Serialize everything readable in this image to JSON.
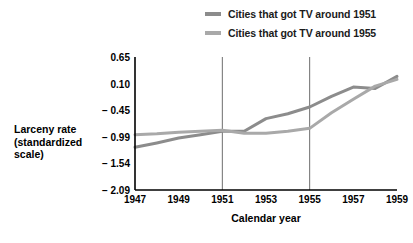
{
  "chart_data": {
    "type": "line",
    "title": "",
    "xlabel": "Calendar year",
    "ylabel": "Larceny rate (standardized scale)",
    "ylabel_lines": [
      "Larceny rate",
      "(standardized",
      "scale)"
    ],
    "x": [
      1947,
      1948,
      1949,
      1950,
      1951,
      1952,
      1953,
      1954,
      1955,
      1956,
      1957,
      1958,
      1959
    ],
    "xticks": [
      "1947",
      "1949",
      "1951",
      "1953",
      "1955",
      "1957",
      "1959"
    ],
    "xtick_values": [
      1947,
      1949,
      1951,
      1953,
      1955,
      1957,
      1959
    ],
    "yticks": [
      "0.65",
      "0.10",
      "− 0.45",
      "− 0.99",
      "− 1.54",
      "− 2.09"
    ],
    "ytick_values": [
      0.65,
      0.1,
      -0.45,
      -0.99,
      -1.54,
      -2.09
    ],
    "xlim": [
      1947,
      1959
    ],
    "ylim": [
      -2.09,
      0.65
    ],
    "grid": false,
    "legend_position": "top-right",
    "reference_lines": [
      1951,
      1955
    ],
    "series": [
      {
        "name": "Cities that got TV around 1951",
        "color": "#8c8c8c",
        "values": [
          -1.21,
          -1.12,
          -1.02,
          -0.95,
          -0.88,
          -0.88,
          -0.62,
          -0.52,
          -0.38,
          -0.16,
          0.03,
          0.0,
          0.25
        ]
      },
      {
        "name": "Cities that got TV around 1955",
        "color": "#a9a9a9",
        "values": [
          -0.95,
          -0.93,
          -0.9,
          -0.88,
          -0.86,
          -0.92,
          -0.92,
          -0.88,
          -0.82,
          -0.5,
          -0.22,
          0.05,
          0.19
        ]
      }
    ]
  },
  "legend": {
    "items": [
      {
        "label": "Cities that got TV around 1951",
        "color": "#8c8c8c"
      },
      {
        "label": "Cities that got TV around 1955",
        "color": "#a9a9a9"
      }
    ]
  },
  "colors": {
    "axis": "#000000",
    "reference_line": "#6e6e6e",
    "background": "#ffffff",
    "series_1951": "#8c8c8c",
    "series_1955": "#a9a9a9"
  }
}
